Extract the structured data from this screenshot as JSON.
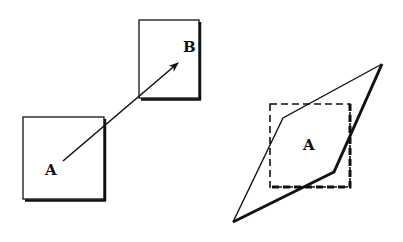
{
  "diagram": {
    "left_panel": {
      "box_a": {
        "label": "A",
        "x": 23,
        "y": 117,
        "w": 81,
        "h": 82
      },
      "box_b": {
        "label": "B",
        "x": 139,
        "y": 20,
        "w": 60,
        "h": 78
      },
      "arrow": {
        "from": [
          63,
          161
        ],
        "to": [
          178,
          63
        ]
      }
    },
    "right_panel": {
      "dashed_square": {
        "label": "A",
        "x": 270,
        "y": 104,
        "w": 80,
        "h": 83
      },
      "transformed_shape": {
        "points": [
          [
            233,
            222
          ],
          [
            283,
            118
          ],
          [
            382,
            64
          ],
          [
            334,
            172
          ]
        ]
      }
    },
    "colors": {
      "stroke": "#111111",
      "background": "#ffffff"
    }
  }
}
